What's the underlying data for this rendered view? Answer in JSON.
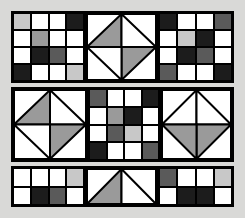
{
  "figure": {
    "background_color": "#d9d9d7",
    "frame_color": "#000000",
    "palette": {
      "white": "#ffffff",
      "light_gray": "#c8c8c8",
      "mid_gray": "#9a9a9a",
      "dark_gray": "#5a5a5a",
      "near_black": "#1c1c1c",
      "line": "#000000"
    },
    "band_count": 3
  },
  "bands": [
    {
      "name": "top-band",
      "x": 11,
      "y": 11,
      "w": 223,
      "h": 72,
      "blocks": [
        {
          "name": "top-left-checker",
          "type": "grid",
          "rows": 4,
          "cols": 4,
          "x": 2,
          "y": 2,
          "w": 71,
          "h": 68,
          "cells": [
            [
              "light_gray",
              "white",
              "white",
              "near_black"
            ],
            [
              "white",
              "mid_gray",
              "white",
              "white"
            ],
            [
              "white",
              "near_black",
              "dark_gray",
              "white"
            ],
            [
              "near_black",
              "white",
              "white",
              "light_gray"
            ]
          ]
        },
        {
          "name": "top-center-diamond",
          "type": "square-in-square",
          "x": 75,
          "y": 2,
          "w": 71,
          "h": 68,
          "corners": [
            "white",
            "white",
            "white",
            "white"
          ],
          "diamond_quadrants": {
            "top": "white",
            "left": "mid_gray",
            "right": "white",
            "bottom": "mid_gray"
          }
        },
        {
          "name": "top-right-checker",
          "type": "grid",
          "rows": 4,
          "cols": 4,
          "x": 148,
          "y": 2,
          "w": 73,
          "h": 68,
          "cells": [
            [
              "near_black",
              "white",
              "white",
              "dark_gray"
            ],
            [
              "white",
              "light_gray",
              "near_black",
              "white"
            ],
            [
              "white",
              "near_black",
              "dark_gray",
              "white"
            ],
            [
              "dark_gray",
              "white",
              "white",
              "near_black"
            ]
          ]
        }
      ]
    },
    {
      "name": "middle-band",
      "x": 11,
      "y": 87,
      "w": 223,
      "h": 75,
      "blocks": [
        {
          "name": "middle-left-diamond",
          "type": "square-in-square",
          "x": 2,
          "y": 2,
          "w": 74,
          "h": 71,
          "corners": [
            "white",
            "white",
            "white",
            "white"
          ],
          "diamond_quadrants": {
            "top": "white",
            "left": "mid_gray",
            "right": "white",
            "bottom": "mid_gray"
          }
        },
        {
          "name": "middle-center-checker",
          "type": "grid",
          "rows": 4,
          "cols": 4,
          "x": 78,
          "y": 2,
          "w": 70,
          "h": 71,
          "cells": [
            [
              "dark_gray",
              "white",
              "white",
              "near_black"
            ],
            [
              "white",
              "mid_gray",
              "near_black",
              "white"
            ],
            [
              "white",
              "dark_gray",
              "light_gray",
              "white"
            ],
            [
              "near_black",
              "white",
              "white",
              "dark_gray"
            ]
          ]
        },
        {
          "name": "middle-right-diamond",
          "type": "square-in-square",
          "x": 150,
          "y": 2,
          "w": 71,
          "h": 71,
          "corners": [
            "white",
            "white",
            "white",
            "white"
          ],
          "diamond_quadrants": {
            "top": "white",
            "left": "white",
            "right": "mid_gray",
            "bottom": "mid_gray"
          }
        }
      ]
    },
    {
      "name": "bottom-band",
      "x": 11,
      "y": 166,
      "w": 223,
      "h": 41,
      "blocks": [
        {
          "name": "bottom-left-checker",
          "type": "grid",
          "rows": 2,
          "cols": 4,
          "x": 2,
          "y": 2,
          "w": 71,
          "h": 37,
          "cells": [
            [
              "white",
              "white",
              "white",
              "light_gray"
            ],
            [
              "white",
              "near_black",
              "dark_gray",
              "white"
            ]
          ]
        },
        {
          "name": "bottom-center-peak",
          "type": "double-triangle",
          "x": 75,
          "y": 2,
          "w": 71,
          "h": 37,
          "left_triangle": "mid_gray",
          "right_triangle": "white",
          "background": "white"
        },
        {
          "name": "bottom-right-checker",
          "type": "grid",
          "rows": 2,
          "cols": 4,
          "x": 148,
          "y": 2,
          "w": 73,
          "h": 37,
          "cells": [
            [
              "dark_gray",
              "white",
              "white",
              "light_gray"
            ],
            [
              "white",
              "near_black",
              "near_black",
              "white"
            ]
          ]
        }
      ]
    }
  ]
}
